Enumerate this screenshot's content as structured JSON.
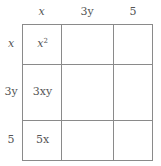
{
  "diagram": {
    "type": "multiplication-area-grid",
    "column_headers": [
      "x",
      "3y",
      "5"
    ],
    "row_headers": [
      "x",
      "3y",
      "5"
    ],
    "cells": [
      [
        "x²",
        "",
        ""
      ],
      [
        "3xy",
        "",
        ""
      ],
      [
        "5x",
        "",
        ""
      ]
    ],
    "colors": {
      "line": "#8a8a8a",
      "text": "#555555"
    }
  }
}
